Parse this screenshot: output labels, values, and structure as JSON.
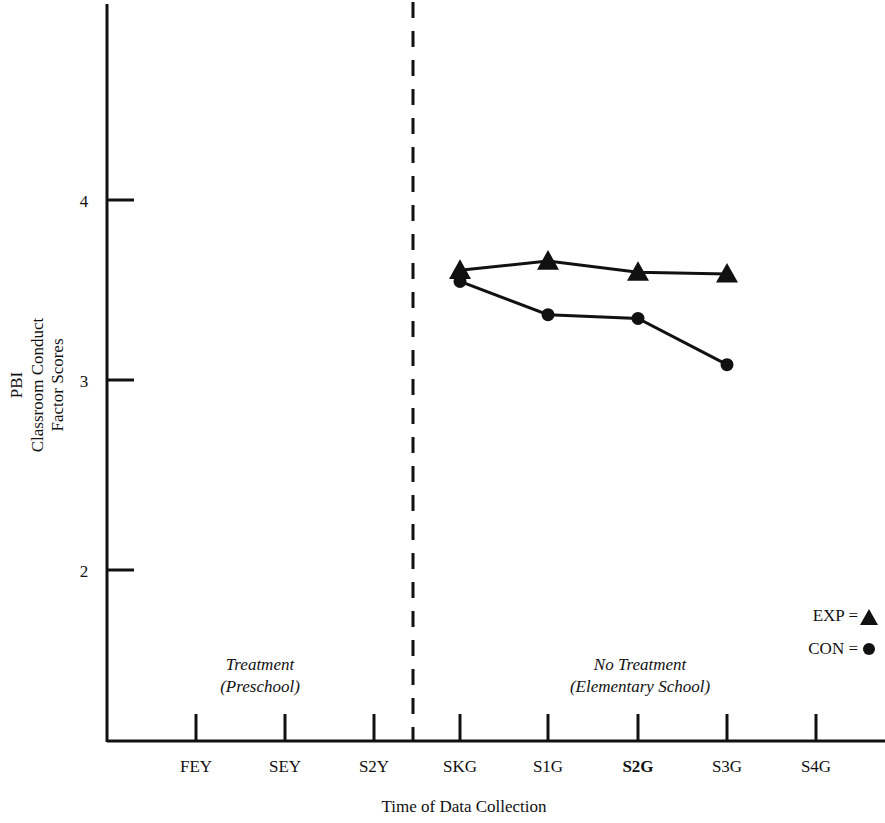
{
  "chart_data": {
    "type": "line",
    "title": "",
    "xlabel": "Time of Data Collection",
    "ylabel": "PBI Classroom Conduct Factor Scores",
    "ylabel_lines": [
      "PBI",
      "Classroom Conduct",
      "Factor Scores"
    ],
    "categories": [
      "FEY",
      "SEY",
      "S2Y",
      "SKG",
      "S1G",
      "S2G",
      "S3G",
      "S4G"
    ],
    "ytick_labels": [
      "4",
      "3",
      "2"
    ],
    "ytick_values": [
      4,
      3,
      2
    ],
    "ylim": [
      1.4,
      4.6
    ],
    "xlim_categories": 8,
    "grid": false,
    "legend_position": "right-middle",
    "series": [
      {
        "name": "EXP",
        "marker": "triangle",
        "legend_label": "EXP = ",
        "legend_marker": "▲",
        "x": [
          "SKG",
          "S1G",
          "S2G",
          "S3G"
        ],
        "values": [
          3.62,
          3.67,
          3.61,
          3.6
        ]
      },
      {
        "name": "CON",
        "marker": "circle",
        "legend_label": "CON = ",
        "legend_marker": "●",
        "x": [
          "SKG",
          "S1G",
          "S2G",
          "S3G"
        ],
        "values": [
          3.56,
          3.38,
          3.36,
          3.11
        ]
      }
    ],
    "annotations": [
      {
        "id": "treatment",
        "lines": [
          "Treatment",
          "(Preschool)"
        ],
        "region": "left"
      },
      {
        "id": "no-treatment",
        "lines": [
          "No Treatment",
          "(Elementary School)"
        ],
        "region": "right"
      }
    ],
    "divider": {
      "after_category": "S2Y",
      "style": "dashed"
    },
    "colors": {
      "ink": "#111111",
      "background": "#ffffff"
    }
  }
}
